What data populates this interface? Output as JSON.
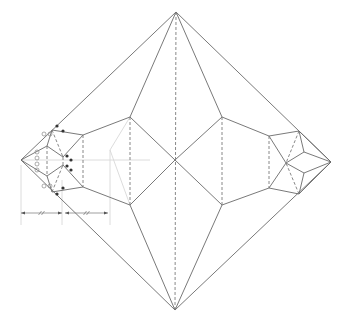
{
  "diagram": {
    "title": "",
    "colors": {
      "background": "#ffffff",
      "crease": "#6a6a6a",
      "guide": "#d8d8d8",
      "marker": "#333333"
    },
    "outline": [
      [
        176,
        12
      ],
      [
        331,
        162
      ],
      [
        175,
        310
      ],
      [
        21,
        160
      ]
    ],
    "mountain_lines": [
      [
        [
          176,
          12
        ],
        [
          130,
          117
        ]
      ],
      [
        [
          176,
          12
        ],
        [
          222,
          117
        ]
      ],
      [
        [
          175,
          310
        ],
        [
          130,
          205
        ]
      ],
      [
        [
          175,
          310
        ],
        [
          222,
          205
        ]
      ],
      [
        [
          130,
          117
        ],
        [
          175,
          160
        ]
      ],
      [
        [
          175,
          160
        ],
        [
          130,
          205
        ]
      ],
      [
        [
          222,
          117
        ],
        [
          175,
          160
        ]
      ],
      [
        [
          175,
          160
        ],
        [
          222,
          205
        ]
      ],
      [
        [
          222,
          117
        ],
        [
          269,
          136
        ]
      ],
      [
        [
          222,
          205
        ],
        [
          269,
          188
        ]
      ],
      [
        [
          130,
          117
        ],
        [
          83,
          135
        ]
      ],
      [
        [
          130,
          205
        ],
        [
          83,
          187
        ]
      ],
      [
        [
          269,
          136
        ],
        [
          299,
          131
        ]
      ],
      [
        [
          269,
          188
        ],
        [
          299,
          194
        ]
      ],
      [
        [
          299,
          131
        ],
        [
          331,
          162
        ]
      ],
      [
        [
          299,
          194
        ],
        [
          331,
          162
        ]
      ],
      [
        [
          269,
          136
        ],
        [
          286,
          163
        ]
      ],
      [
        [
          269,
          188
        ],
        [
          286,
          163
        ]
      ],
      [
        [
          286,
          163
        ],
        [
          304,
          152
        ]
      ],
      [
        [
          286,
          163
        ],
        [
          304,
          173
        ]
      ],
      [
        [
          304,
          152
        ],
        [
          331,
          162
        ]
      ],
      [
        [
          304,
          173
        ],
        [
          331,
          162
        ]
      ],
      [
        [
          299,
          131
        ],
        [
          304,
          152
        ]
      ],
      [
        [
          299,
          194
        ],
        [
          304,
          173
        ]
      ],
      [
        [
          83,
          135
        ],
        [
          63,
          157
        ]
      ],
      [
        [
          83,
          187
        ],
        [
          63,
          165
        ]
      ],
      [
        [
          21,
          160
        ],
        [
          47,
          146
        ]
      ],
      [
        [
          21,
          160
        ],
        [
          47,
          176
        ]
      ],
      [
        [
          47,
          146
        ],
        [
          63,
          157
        ]
      ],
      [
        [
          47,
          176
        ],
        [
          63,
          165
        ]
      ],
      [
        [
          47,
          146
        ],
        [
          52,
          130
        ]
      ],
      [
        [
          47,
          176
        ],
        [
          52,
          192
        ]
      ],
      [
        [
          52,
          130
        ],
        [
          83,
          135
        ]
      ],
      [
        [
          52,
          192
        ],
        [
          83,
          187
        ]
      ]
    ],
    "valley_lines": [
      [
        [
          176,
          12
        ],
        [
          175,
          310
        ]
      ],
      [
        [
          130,
          117
        ],
        [
          130,
          205
        ]
      ],
      [
        [
          222,
          117
        ],
        [
          222,
          205
        ]
      ],
      [
        [
          269,
          136
        ],
        [
          269,
          188
        ]
      ],
      [
        [
          83,
          135
        ],
        [
          83,
          187
        ]
      ],
      [
        [
          299,
          131
        ],
        [
          286,
          163
        ]
      ],
      [
        [
          299,
          194
        ],
        [
          286,
          163
        ]
      ],
      [
        [
          63,
          157
        ],
        [
          63,
          165
        ]
      ],
      [
        [
          47,
          146
        ],
        [
          47,
          176
        ]
      ],
      [
        [
          52,
          130
        ],
        [
          63,
          157
        ]
      ],
      [
        [
          52,
          192
        ],
        [
          63,
          165
        ]
      ]
    ],
    "guide_lines": [
      [
        [
          21,
          160
        ],
        [
          150,
          160
        ]
      ],
      [
        [
          110,
          150
        ],
        [
          110,
          225
        ]
      ],
      [
        [
          110,
          150
        ],
        [
          130,
          117
        ]
      ],
      [
        [
          110,
          150
        ],
        [
          130,
          205
        ]
      ],
      [
        [
          21,
          165
        ],
        [
          21,
          225
        ]
      ],
      [
        [
          62,
          180
        ],
        [
          62,
          225
        ]
      ]
    ],
    "dimension": {
      "y": 213,
      "segments": [
        [
          21,
          62
        ],
        [
          65,
          108
        ]
      ],
      "tick_label": "//"
    },
    "black_dots": [
      [
        57,
        126
      ],
      [
        63,
        131
      ],
      [
        67,
        156
      ],
      [
        71,
        160
      ],
      [
        67,
        166
      ],
      [
        71,
        170
      ],
      [
        63,
        188
      ],
      [
        57,
        194
      ]
    ],
    "open_circles": [
      [
        44,
        134
      ],
      [
        50,
        134
      ],
      [
        37,
        152
      ],
      [
        37,
        158
      ],
      [
        37,
        164
      ],
      [
        37,
        170
      ],
      [
        44,
        186
      ],
      [
        50,
        186
      ]
    ]
  }
}
